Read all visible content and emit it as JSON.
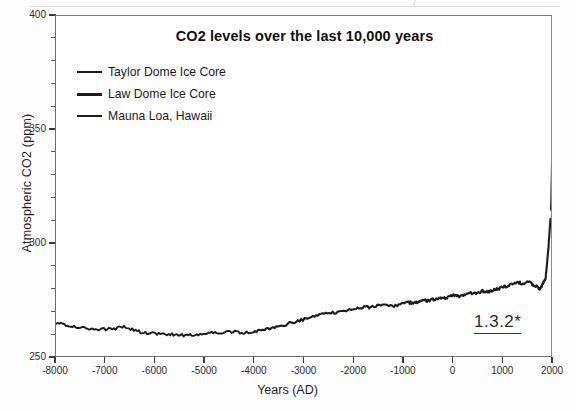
{
  "chart_data": {
    "type": "line",
    "title": "CO2 levels over the last 10,000 years",
    "xlabel": "Years (AD)",
    "ylabel": "Atmospheric CO2 (ppm)",
    "xlim": [
      -8000,
      2000
    ],
    "ylim": [
      250,
      400
    ],
    "ytick_labels": [
      "400",
      "350",
      "300",
      "250"
    ],
    "ytick_values": [
      400,
      350,
      300,
      250
    ],
    "ytick_minor_step": 10,
    "xtick_labels": [
      "-8000",
      "-7000",
      "-6000",
      "-5000",
      "-4000",
      "-3000",
      "-2000",
      "-1000",
      "0",
      "1000",
      "2000"
    ],
    "xtick_values": [
      -8000,
      -7000,
      -6000,
      -5000,
      -4000,
      -3000,
      -2000,
      -1000,
      0,
      1000,
      2000
    ],
    "grid": false,
    "legend_position": "upper-left",
    "line_color": "#1b1b1b",
    "annotation": "1.3.2*",
    "series": [
      {
        "name": "Taylor Dome Ice Core",
        "swatch": "solid",
        "x": [
          -8000,
          -7800,
          -7600,
          -7400,
          -7200,
          -7000,
          -6800,
          -6600,
          -6400,
          -6200,
          -6000,
          -5800,
          -5600,
          -5400,
          -5200,
          -5000,
          -4800,
          -4600,
          -4400,
          -4200,
          -4000
        ],
        "y": [
          265.4,
          264.6,
          263.6,
          262.9,
          262.6,
          262.7,
          263.0,
          263.8,
          262.0,
          261.0,
          260.6,
          260.4,
          260.2,
          260.0,
          260.3,
          260.8,
          261.2,
          261.3,
          261.4,
          261.0,
          261.6
        ]
      },
      {
        "name": "Law Dome Ice Core",
        "swatch": "thick",
        "x": [
          -4000,
          -3800,
          -3600,
          -3400,
          -3200,
          -3000,
          -2800,
          -2600,
          -2400,
          -2200,
          -2000,
          -1800,
          -1600,
          -1400,
          -1200,
          -1000,
          -900,
          -800,
          -700,
          -600,
          -500,
          -400,
          -300,
          -200,
          -100,
          0,
          100,
          200,
          300,
          400,
          500,
          600,
          700,
          800,
          900,
          1000,
          1100,
          1200,
          1300,
          1400,
          1500,
          1600,
          1700,
          1750,
          1800,
          1850,
          1900,
          1950
        ],
        "y": [
          261.6,
          262.4,
          263.4,
          264.6,
          265.8,
          267.0,
          268.2,
          269.2,
          270.0,
          270.8,
          271.5,
          272.2,
          272.6,
          273.2,
          273.0,
          273.8,
          274.4,
          274.0,
          274.8,
          275.4,
          275.0,
          275.8,
          276.4,
          276.0,
          276.8,
          277.4,
          277.0,
          277.8,
          278.4,
          278.0,
          278.8,
          279.4,
          279.0,
          279.8,
          280.4,
          281.2,
          281.8,
          282.4,
          283.2,
          282.4,
          283.6,
          282.0,
          281.0,
          280.2,
          282.8,
          284.6,
          296.0,
          311.0
        ]
      },
      {
        "name": "Mauna Loa, Hawaii",
        "swatch": "solid",
        "x": [
          1958,
          1965,
          1970,
          1975,
          1980,
          1985,
          1990,
          1995,
          2000,
          2005
        ],
        "y": [
          315.0,
          320.0,
          325.7,
          331.1,
          338.7,
          346.0,
          354.4,
          360.8,
          369.5,
          385.0
        ]
      }
    ]
  },
  "annotations": {
    "figure_number": "1.3.2*"
  }
}
